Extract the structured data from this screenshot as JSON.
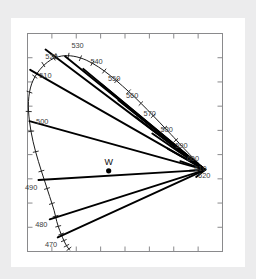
{
  "figure": {
    "name": "cie-chromaticity-diagram",
    "background_color": "#ececed",
    "panel_color": "#ffffff",
    "frame_color": "#8a8a8c",
    "line_color": "#000000"
  },
  "white_point": {
    "label": "W",
    "x": 0.333,
    "y": 0.333
  },
  "chart_data": {
    "type": "line",
    "title": "",
    "subtitle": "",
    "xlabel": "",
    "ylabel": "",
    "xlim": [
      0.0,
      0.8
    ],
    "ylim": [
      0.0,
      0.9
    ],
    "grid": false,
    "legend": false,
    "legend_position": "none",
    "annotations": [
      "W"
    ],
    "wavelength_labels": [
      "470",
      "480",
      "490",
      "500",
      "510",
      "520",
      "530",
      "540",
      "550",
      "560",
      "570",
      "580",
      "590",
      "600",
      "610",
      "620"
    ],
    "series": [
      {
        "name": "spectral-locus",
        "points_xy": [
          [
            0.174,
            0.005
          ],
          [
            0.164,
            0.018
          ],
          [
            0.154,
            0.035
          ],
          [
            0.144,
            0.057
          ],
          [
            0.132,
            0.087
          ],
          [
            0.12,
            0.124
          ],
          [
            0.109,
            0.17
          ],
          [
            0.091,
            0.227
          ],
          [
            0.069,
            0.295
          ],
          [
            0.045,
            0.371
          ],
          [
            0.023,
            0.453
          ],
          [
            0.008,
            0.538
          ],
          [
            0.004,
            0.62
          ],
          [
            0.017,
            0.692
          ],
          [
            0.05,
            0.75
          ],
          [
            0.094,
            0.79
          ],
          [
            0.14,
            0.807
          ],
          [
            0.19,
            0.806
          ],
          [
            0.241,
            0.79
          ],
          [
            0.291,
            0.762
          ],
          [
            0.34,
            0.726
          ],
          [
            0.39,
            0.683
          ],
          [
            0.441,
            0.636
          ],
          [
            0.491,
            0.586
          ],
          [
            0.541,
            0.534
          ],
          [
            0.589,
            0.483
          ],
          [
            0.634,
            0.434
          ],
          [
            0.666,
            0.4
          ],
          [
            0.69,
            0.376
          ],
          [
            0.707,
            0.359
          ],
          [
            0.719,
            0.347
          ],
          [
            0.729,
            0.337
          ]
        ]
      },
      {
        "name": "dominant-wavelength-lines",
        "endpoints": [
          {
            "label": "470",
            "locus_xy": [
              0.124,
              0.058
            ]
          },
          {
            "label": "480",
            "locus_xy": [
              0.091,
              0.133
            ]
          },
          {
            "label": "490",
            "locus_xy": [
              0.045,
              0.295
            ]
          },
          {
            "label": "500",
            "locus_xy": [
              0.008,
              0.538
            ]
          },
          {
            "label": "510",
            "locus_xy": [
              0.011,
              0.75
            ]
          },
          {
            "label": "520",
            "locus_xy": [
              0.074,
              0.834
            ]
          },
          {
            "label": "530",
            "locus_xy": [
              0.154,
              0.806
            ]
          },
          {
            "label": "540",
            "locus_xy": [
              0.229,
              0.754
            ]
          },
          {
            "label": "550",
            "locus_xy": [
              0.302,
              0.692
            ]
          },
          {
            "label": "560",
            "locus_xy": [
              0.373,
              0.624
            ]
          },
          {
            "label": "570",
            "locus_xy": [
              0.444,
              0.555
            ]
          },
          {
            "label": "580",
            "locus_xy": [
              0.512,
              0.487
            ]
          },
          {
            "label": "590",
            "locus_xy": [
              0.575,
              0.425
            ]
          },
          {
            "label": "600",
            "locus_xy": [
              0.627,
              0.373
            ]
          },
          {
            "label": "610",
            "locus_xy": [
              0.666,
              0.334
            ]
          },
          {
            "label": "620",
            "locus_xy": [
              0.692,
              0.308
            ]
          }
        ],
        "converge_at": "white-point-opposite-extreme"
      }
    ],
    "x_ticks": [
      0.0,
      0.1,
      0.2,
      0.3,
      0.4,
      0.5,
      0.6,
      0.7,
      0.8
    ],
    "y_ticks": [
      0.0,
      0.1,
      0.2,
      0.3,
      0.4,
      0.5,
      0.6,
      0.7,
      0.8,
      0.9
    ],
    "x_tick_labels": [
      "",
      "",
      "",
      "",
      "",
      "",
      "",
      "",
      ""
    ],
    "y_tick_labels": [
      "",
      "",
      "",
      "",
      "",
      "",
      "",
      "",
      "",
      ""
    ]
  }
}
